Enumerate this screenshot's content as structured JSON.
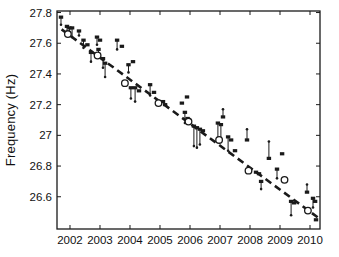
{
  "figure": {
    "ylabel": "Frequency (Hz)",
    "xlabel": "",
    "title": ""
  },
  "colors": {
    "background": "#ffffff",
    "axis": "#1a1a1a",
    "marker": "#1a1a1a",
    "trend": "#1a1a1a",
    "circle_fill": "#ffffff"
  },
  "chart_data": {
    "type": "scatter",
    "title": "",
    "xlabel": "",
    "ylabel": "Frequency (Hz)",
    "grid": false,
    "legend_position": "none",
    "xlim": [
      2001.567,
      2010.333
    ],
    "ylim": [
      26.39,
      27.81
    ],
    "x_ticks": [
      2002,
      2003,
      2004,
      2005,
      2006,
      2007,
      2008,
      2009,
      2010
    ],
    "x_tick_labels": [
      "2002",
      "2003",
      "2004",
      "2005",
      "2006",
      "2007",
      "2008",
      "2009",
      "2010"
    ],
    "y_ticks": [
      26.6,
      26.8,
      27.0,
      27.2,
      27.4,
      27.6,
      27.8
    ],
    "y_tick_labels": [
      "26.6",
      "26.8",
      "27",
      "27.2",
      "27.4",
      "27.6",
      "27.8"
    ],
    "trend_line": {
      "style": "dashed",
      "x1": 2001.72,
      "y1": 27.69,
      "x2": 2010.3,
      "y2": 26.46
    },
    "series": [
      {
        "name": "measurements",
        "marker": "filled-square",
        "error_bars": true,
        "points": [
          {
            "x": 2001.7,
            "y": 27.77,
            "y2": 27.72
          },
          {
            "x": 2001.9,
            "y": 27.71,
            "y2": 27.65
          },
          {
            "x": 2001.98,
            "y": 27.7,
            "y2": 27.65
          },
          {
            "x": 2002.07,
            "y": 27.7,
            "y2": 27.64
          },
          {
            "x": 2002.3,
            "y": 27.68,
            "y2": 27.65
          },
          {
            "x": 2002.45,
            "y": 27.62,
            "y2": 27.57
          },
          {
            "x": 2002.58,
            "y": 27.59
          },
          {
            "x": 2002.7,
            "y": 27.54,
            "y2": 27.48
          },
          {
            "x": 2002.9,
            "y": 27.64,
            "y2": 27.59
          },
          {
            "x": 2003.0,
            "y": 27.62
          },
          {
            "x": 2002.95,
            "y": 27.56,
            "y2": 27.51
          },
          {
            "x": 2003.1,
            "y": 27.5,
            "y2": 27.44
          },
          {
            "x": 2003.17,
            "y": 27.47,
            "y2": 27.38
          },
          {
            "x": 2003.57,
            "y": 27.62,
            "y2": 27.56
          },
          {
            "x": 2003.73,
            "y": 27.58
          },
          {
            "x": 2003.95,
            "y": 27.46,
            "y2": 27.41
          },
          {
            "x": 2004.1,
            "y": 27.48
          },
          {
            "x": 2004.03,
            "y": 27.31,
            "y2": 27.24
          },
          {
            "x": 2004.17,
            "y": 27.31,
            "y2": 27.22
          },
          {
            "x": 2004.3,
            "y": 27.29
          },
          {
            "x": 2004.67,
            "y": 27.33,
            "y2": 27.26
          },
          {
            "x": 2004.8,
            "y": 27.28
          },
          {
            "x": 2005.1,
            "y": 27.22
          },
          {
            "x": 2005.17,
            "y": 27.2
          },
          {
            "x": 2005.73,
            "y": 27.21
          },
          {
            "x": 2005.83,
            "y": 27.15,
            "y2": 27.08
          },
          {
            "x": 2005.9,
            "y": 27.25
          },
          {
            "x": 2005.92,
            "y": 27.11
          },
          {
            "x": 2006.13,
            "y": 27.06,
            "y2": 26.93
          },
          {
            "x": 2006.23,
            "y": 27.05,
            "y2": 26.92
          },
          {
            "x": 2006.33,
            "y": 27.04,
            "y2": 26.94
          },
          {
            "x": 2006.43,
            "y": 27.03
          },
          {
            "x": 2006.93,
            "y": 27.08,
            "y2": 26.98
          },
          {
            "x": 2007.03,
            "y": 27.07,
            "y2": 26.98
          },
          {
            "x": 2007.1,
            "y": 27.12,
            "y2": 27.17
          },
          {
            "x": 2007.27,
            "y": 26.99,
            "y2": 26.9
          },
          {
            "x": 2007.37,
            "y": 26.97
          },
          {
            "x": 2007.5,
            "y": 26.9
          },
          {
            "x": 2007.9,
            "y": 26.97,
            "y2": 27.04
          },
          {
            "x": 2008.2,
            "y": 26.76
          },
          {
            "x": 2008.3,
            "y": 26.75
          },
          {
            "x": 2008.37,
            "y": 26.7,
            "y2": 26.65
          },
          {
            "x": 2008.63,
            "y": 26.85,
            "y2": 26.96
          },
          {
            "x": 2008.9,
            "y": 26.78,
            "y2": 26.72
          },
          {
            "x": 2009.07,
            "y": 26.88
          },
          {
            "x": 2009.37,
            "y": 26.57,
            "y2": 26.48
          },
          {
            "x": 2009.47,
            "y": 26.56
          },
          {
            "x": 2009.9,
            "y": 26.63,
            "y2": 26.68
          },
          {
            "x": 2010.1,
            "y": 26.59,
            "y2": 26.53
          },
          {
            "x": 2010.17,
            "y": 26.57
          },
          {
            "x": 2010.2,
            "y": 26.45
          }
        ]
      },
      {
        "name": "annual means",
        "marker": "open-circle",
        "error_bars": false,
        "points": [
          {
            "x": 2001.93,
            "y": 27.66
          },
          {
            "x": 2002.92,
            "y": 27.52
          },
          {
            "x": 2003.83,
            "y": 27.34
          },
          {
            "x": 2004.95,
            "y": 27.21
          },
          {
            "x": 2005.95,
            "y": 27.09
          },
          {
            "x": 2006.97,
            "y": 26.97
          },
          {
            "x": 2007.95,
            "y": 26.77
          },
          {
            "x": 2009.15,
            "y": 26.71
          },
          {
            "x": 2009.93,
            "y": 26.51
          }
        ]
      }
    ]
  },
  "plot_area": {
    "left": 57,
    "top": 11,
    "right": 320,
    "bottom": 229
  }
}
